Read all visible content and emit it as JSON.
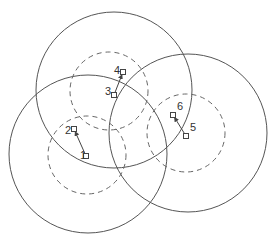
{
  "diagram": {
    "width": 274,
    "height": 243,
    "colors": {
      "stroke": "#555555",
      "dashed": "#666666",
      "node": "#444444",
      "text": "#333333",
      "background": "#ffffff"
    },
    "outer_circles": [
      {
        "id": "top",
        "cx": 114,
        "cy": 90,
        "r": 78
      },
      {
        "id": "left",
        "cx": 88,
        "cy": 154,
        "r": 79
      },
      {
        "id": "right",
        "cx": 188,
        "cy": 133,
        "r": 79
      }
    ],
    "inner_circles": [
      {
        "id": "top",
        "cx": 109,
        "cy": 91,
        "r": 39
      },
      {
        "id": "left",
        "cx": 87,
        "cy": 155,
        "r": 39
      },
      {
        "id": "right",
        "cx": 186,
        "cy": 133,
        "r": 39
      }
    ],
    "nodes": [
      {
        "id": "1",
        "label": "1",
        "x": 86,
        "y": 156,
        "label_dx": -6,
        "label_dy": 3
      },
      {
        "id": "2",
        "label": "2",
        "x": 74,
        "y": 129,
        "label_dx": -9,
        "label_dy": 5
      },
      {
        "id": "3",
        "label": "3",
        "x": 114,
        "y": 95,
        "label_dx": -9,
        "label_dy": 0
      },
      {
        "id": "4",
        "label": "4",
        "x": 123,
        "y": 72,
        "label_dx": -9,
        "label_dy": 2
      },
      {
        "id": "5",
        "label": "5",
        "x": 186,
        "y": 136,
        "label_dx": 4,
        "label_dy": -5
      },
      {
        "id": "6",
        "label": "6",
        "x": 173,
        "y": 115,
        "label_dx": 4,
        "label_dy": -5
      }
    ],
    "links": [
      {
        "from": "1",
        "to": "2"
      },
      {
        "from": "3",
        "to": "4"
      },
      {
        "from": "5",
        "to": "6"
      }
    ]
  }
}
